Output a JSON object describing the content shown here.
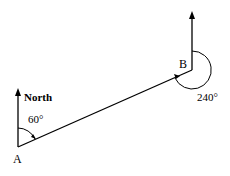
{
  "diagram": {
    "type": "bearing-diagram",
    "points": {
      "A": {
        "label": "A"
      },
      "B": {
        "label": "B"
      }
    },
    "north_label": "North",
    "angle_at_A": "60°",
    "angle_at_B": "240°",
    "colors": {
      "line": "#000000",
      "background": "#ffffff"
    }
  }
}
